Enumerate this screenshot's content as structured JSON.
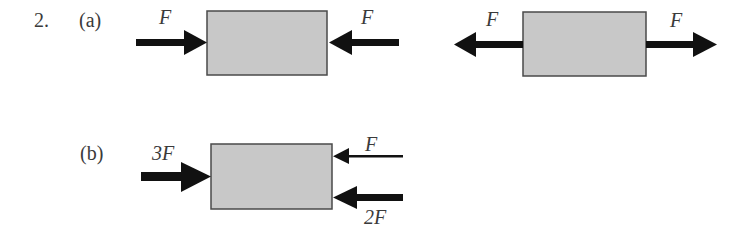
{
  "problem": {
    "number": "2.",
    "parts": [
      {
        "label": "(a)",
        "diagrams": [
          {
            "name": "compression",
            "forces": [
              {
                "label": "F",
                "direction": "right",
                "side": "left",
                "magnitude": 1
              },
              {
                "label": "F",
                "direction": "left",
                "side": "right",
                "magnitude": 1
              }
            ]
          },
          {
            "name": "tension",
            "forces": [
              {
                "label": "F",
                "direction": "left",
                "side": "left",
                "magnitude": 1
              },
              {
                "label": "F",
                "direction": "right",
                "side": "right",
                "magnitude": 1
              }
            ]
          }
        ]
      },
      {
        "label": "(b)",
        "diagrams": [
          {
            "name": "unbalanced",
            "forces": [
              {
                "label": "3F",
                "direction": "right",
                "side": "left",
                "magnitude": 3
              },
              {
                "label": "F",
                "direction": "left",
                "side": "right-top",
                "magnitude": 1
              },
              {
                "label": "2F",
                "direction": "left",
                "side": "right-bottom",
                "magnitude": 2
              }
            ]
          }
        ]
      }
    ]
  },
  "colors": {
    "block_fill": "#c8c8c8",
    "block_stroke": "#4a4a4a",
    "arrow": "#111111"
  }
}
